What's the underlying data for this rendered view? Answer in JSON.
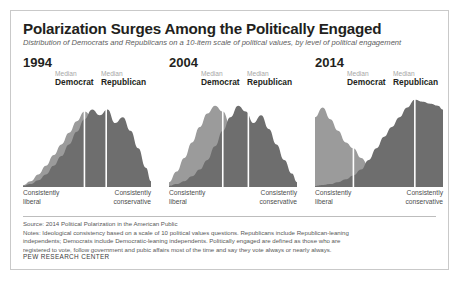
{
  "figure": {
    "title": "Polarization Surges Among the Politically Engaged",
    "subtitle": "Distribution of Democrats and Republicans on a 10-item scale of political values, by level of political engagement",
    "source": "Source: 2014 Political Polarization in the American Public",
    "notes_line1": "Notes: Ideological consistency based on a scale of 10 political values questions. Republicans include Republican-leaning",
    "notes_line2": "independents; Democrats include Democratic-leaning independents. Politically engaged are defined as those who are",
    "notes_line3": "registered to vote, follow government and pubic affairs most of the time and say they vote always or nearly always.",
    "org": "PEW RESEARCH CENTER",
    "colors": {
      "democrat": "#9b9b9b",
      "republican": "#6e6e6e",
      "median_line": "#ffffff",
      "title": "#231f20",
      "subtitle": "#5d5d5d",
      "border": "#c9c9c9"
    }
  },
  "axis": {
    "left_line1": "Consistently",
    "left_line2": "liberal",
    "right_line1": "Consistently",
    "right_line2": "conservative"
  },
  "median": {
    "word": "Median",
    "democrat": "Democrat",
    "republican": "Republican"
  },
  "chart_data": {
    "type": "area",
    "title": "Polarization Surges Among the Politically Engaged",
    "xlabel": "Ideological consistency (consistently liberal → consistently conservative)",
    "ylabel": "Share of politically engaged",
    "xlim": [
      0,
      100
    ],
    "grid": false,
    "legend": [
      "Democrat",
      "Republican"
    ],
    "legend_position": "inline-median-labels",
    "panels": [
      {
        "year": "1994",
        "median_democrat_x": 48,
        "median_republican_x": 65,
        "series": [
          {
            "name": "Democrat",
            "color": "#9b9b9b",
            "x": [
              0,
              6,
              12,
              18,
              24,
              30,
              36,
              42,
              48,
              54,
              60,
              66,
              72,
              78,
              84,
              90,
              96,
              100
            ],
            "values": [
              2,
              6,
              13,
              22,
              33,
              44,
              56,
              68,
              78,
              73,
              62,
              48,
              35,
              24,
              15,
              8,
              3,
              1
            ]
          },
          {
            "name": "Republican",
            "color": "#6e6e6e",
            "x": [
              0,
              6,
              12,
              18,
              24,
              30,
              36,
              42,
              48,
              54,
              60,
              66,
              72,
              78,
              84,
              90,
              96,
              100
            ],
            "values": [
              1,
              3,
              7,
              13,
              22,
              32,
              44,
              57,
              70,
              80,
              74,
              80,
              66,
              72,
              58,
              40,
              20,
              6
            ]
          }
        ]
      },
      {
        "year": "2004",
        "median_democrat_x": 42,
        "median_republican_x": 62,
        "series": [
          {
            "name": "Democrat",
            "color": "#9b9b9b",
            "x": [
              0,
              6,
              12,
              18,
              24,
              30,
              36,
              42,
              48,
              54,
              60,
              66,
              72,
              78,
              84,
              90,
              96,
              100
            ],
            "values": [
              5,
              16,
              30,
              46,
              62,
              76,
              84,
              78,
              64,
              50,
              38,
              28,
              20,
              13,
              8,
              4,
              2,
              1
            ]
          },
          {
            "name": "Republican",
            "color": "#6e6e6e",
            "x": [
              0,
              6,
              12,
              18,
              24,
              30,
              36,
              42,
              48,
              54,
              60,
              66,
              72,
              78,
              84,
              90,
              96,
              100
            ],
            "values": [
              1,
              3,
              6,
              11,
              18,
              28,
              42,
              58,
              72,
              84,
              78,
              66,
              74,
              60,
              44,
              28,
              14,
              5
            ]
          }
        ]
      },
      {
        "year": "2014",
        "median_democrat_x": 30,
        "median_republican_x": 78,
        "series": [
          {
            "name": "Democrat",
            "color": "#9b9b9b",
            "x": [
              0,
              6,
              12,
              18,
              24,
              30,
              36,
              42,
              48,
              54,
              60,
              66,
              72,
              78,
              84,
              90,
              96,
              100
            ],
            "values": [
              72,
              82,
              70,
              58,
              46,
              40,
              30,
              22,
              16,
              11,
              8,
              5,
              4,
              3,
              2,
              1,
              1,
              0
            ]
          },
          {
            "name": "Republican",
            "color": "#6e6e6e",
            "x": [
              0,
              6,
              12,
              18,
              24,
              30,
              36,
              42,
              48,
              54,
              60,
              66,
              72,
              78,
              84,
              90,
              96,
              100
            ],
            "values": [
              1,
              2,
              3,
              5,
              8,
              12,
              18,
              28,
              40,
              52,
              62,
              72,
              82,
              90,
              88,
              86,
              84,
              80
            ]
          }
        ]
      }
    ]
  }
}
